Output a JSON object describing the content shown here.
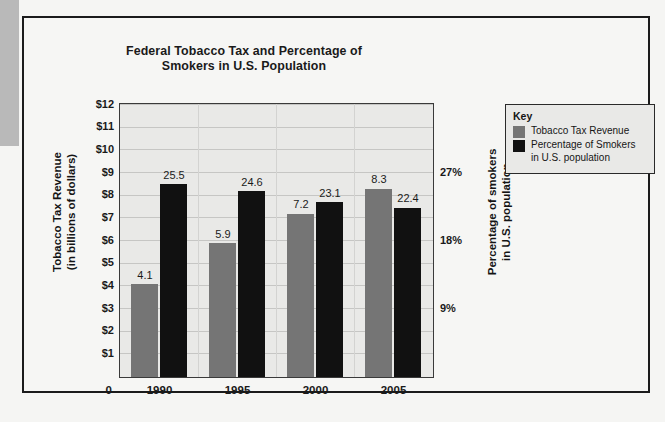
{
  "chart_data": {
    "type": "bar",
    "title": "Federal Tobacco Tax and Percentage of Smokers in U.S. Population",
    "title_line1": "Federal Tobacco Tax and Percentage of",
    "title_line2": "Smokers in U.S. Population",
    "categories": [
      "1990",
      "1995",
      "2000",
      "2005"
    ],
    "xlabel": "",
    "series": [
      {
        "name": "Tobacco Tax Revenue",
        "axis": "left",
        "color": "#757575",
        "values": [
          4.1,
          5.9,
          7.2,
          8.3
        ],
        "labels": [
          "4.1",
          "5.9",
          "7.2",
          "8.3"
        ]
      },
      {
        "name": "Percentage of Smokers in U.S. population",
        "axis": "right",
        "color": "#111111",
        "values": [
          25.5,
          24.6,
          23.1,
          22.4
        ],
        "labels": [
          "25.5",
          "24.6",
          "23.1",
          "22.4"
        ]
      }
    ],
    "left_axis": {
      "label_line1": "Tobacco Tax Revenue",
      "label_line2": "(in billions of dollars)",
      "ticks": [
        "$12",
        "$11",
        "$10",
        "$9",
        "$8",
        "$7",
        "$6",
        "$5",
        "$4",
        "$3",
        "$2",
        "$1"
      ],
      "tick_values": [
        12,
        11,
        10,
        9,
        8,
        7,
        6,
        5,
        4,
        3,
        2,
        1
      ],
      "zero_label": "0",
      "ylim": [
        0,
        12
      ]
    },
    "right_axis": {
      "label_line1": "Percentage of smokers",
      "label_line2": "in U.S. population",
      "ticks": [
        "27%",
        "18%",
        "9%"
      ],
      "tick_values": [
        27,
        18,
        9
      ],
      "ylim": [
        0,
        36
      ]
    },
    "grid": true,
    "legend_position": "right-top"
  },
  "legend": {
    "title": "Key",
    "items": [
      {
        "label": "Tobacco Tax Revenue",
        "color": "#757575"
      },
      {
        "label_line1": "Percentage of Smokers",
        "label_line2": "in U.S. population",
        "color": "#111111"
      }
    ]
  }
}
